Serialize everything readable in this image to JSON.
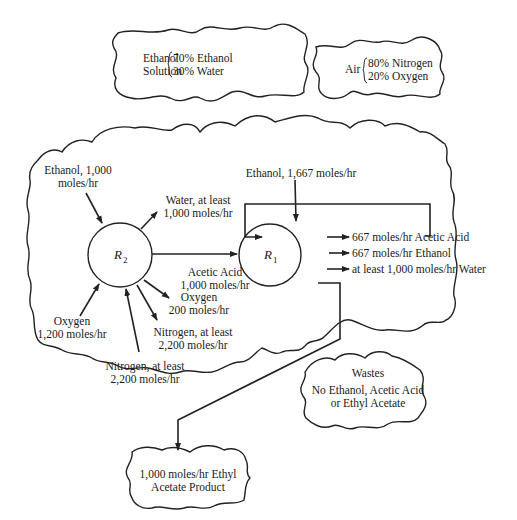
{
  "feeds": {
    "ethanol_solution": {
      "name_line1": "Ethanol",
      "name_line2": "Solution",
      "comp1": "70% Ethanol",
      "comp2": "30% Water"
    },
    "air": {
      "name": "Air",
      "comp1": "80% Nitrogen",
      "comp2": "20% Oxygen"
    }
  },
  "reactor_r2": {
    "label": "R",
    "subscript": "2",
    "inputs": {
      "ethanol_line1": "Ethanol, 1,000",
      "ethanol_line2": "moles/hr",
      "oxygen_line1": "Oxygen",
      "oxygen_line2": "1,200 moles/hr",
      "nitrogen_line1": "Nitrogen, at least",
      "nitrogen_line2": "2,200 moles/hr"
    },
    "outputs": {
      "water_line1": "Water, at least",
      "water_line2": "1,000 moles/hr",
      "acetic_line1": "Acetic Acid",
      "acetic_line2": "1,000 moles/hr",
      "oxygen_line1": "Oxygen",
      "oxygen_line2": "200 moles/hr",
      "nitrogen_line1": "Nitrogen, at least",
      "nitrogen_line2": "2,200 moles/hr"
    }
  },
  "reactor_r1": {
    "label": "R",
    "subscript": "1",
    "inputs": {
      "ethanol": "Ethanol, 1,667 moles/hr"
    },
    "outputs": {
      "acetic": "667 moles/hr Acetic Acid",
      "ethanol": "667 moles/hr Ethanol",
      "water": "at least 1,000 moles/hr Water"
    }
  },
  "wastes": {
    "title": "Wastes",
    "line1": "No Ethanol, Acetic Acid",
    "line2": "or Ethyl Acetate"
  },
  "product": {
    "line1": "1,000 moles/hr Ethyl",
    "line2": "Acetate Product"
  }
}
